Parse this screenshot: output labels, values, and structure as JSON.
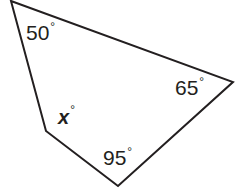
{
  "figure": {
    "type": "quadrilateral-angle-diagram",
    "background_color": "#ffffff",
    "stroke_color": "#231f20",
    "stroke_width": 2,
    "fill_color": "#ffffff",
    "width": 238,
    "height": 188,
    "vertices": [
      {
        "name": "top-left-vertex",
        "x": 11,
        "y": 1,
        "angle_label": "50"
      },
      {
        "name": "right-vertex",
        "x": 233,
        "y": 82,
        "angle_label": "65"
      },
      {
        "name": "bottom-vertex",
        "x": 118,
        "y": 186,
        "angle_label": "95"
      },
      {
        "name": "left-vertex",
        "x": 46,
        "y": 131,
        "angle_label": "x"
      }
    ],
    "polygon_points": "11,1 233,82 118,186 46,131"
  },
  "labels": {
    "angle_top_left": {
      "value": "50",
      "degree": "°"
    },
    "angle_right": {
      "value": "65",
      "degree": "°"
    },
    "angle_bottom": {
      "value": "95",
      "degree": "°"
    },
    "angle_unknown": {
      "value": "x",
      "degree": "°"
    }
  }
}
